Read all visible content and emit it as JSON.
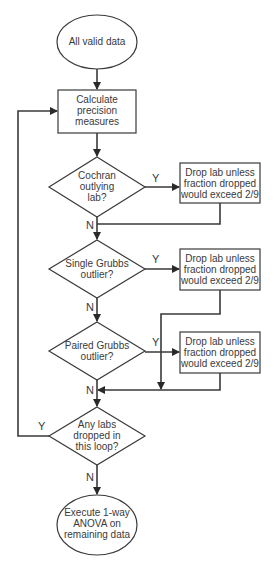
{
  "diagram": {
    "type": "flowchart",
    "nodes": {
      "start": {
        "shape": "oval",
        "lines": [
          "All valid data"
        ]
      },
      "calc": {
        "shape": "rect",
        "lines": [
          "Calculate",
          "precision",
          "measures"
        ]
      },
      "cochran": {
        "shape": "diamond",
        "lines": [
          "Cochran",
          "outlying",
          "lab?"
        ]
      },
      "drop1": {
        "shape": "rect",
        "lines": [
          "Drop lab unless",
          "fraction dropped",
          "would exceed 2/9"
        ]
      },
      "single": {
        "shape": "diamond",
        "lines": [
          "Single Grubbs",
          "outlier?"
        ]
      },
      "drop2": {
        "shape": "rect",
        "lines": [
          "Drop lab unless",
          "fraction dropped",
          "would exceed 2/9"
        ]
      },
      "paired": {
        "shape": "diamond",
        "lines": [
          "Paired Grubbs",
          "outlier?"
        ]
      },
      "drop3": {
        "shape": "rect",
        "lines": [
          "Drop lab unless",
          "fraction dropped",
          "would exceed 2/9"
        ]
      },
      "any": {
        "shape": "diamond",
        "lines": [
          "Any labs",
          "dropped in",
          "this loop?"
        ]
      },
      "end": {
        "shape": "oval",
        "lines": [
          "Execute 1-way",
          "ANOVA on",
          "remaining data"
        ]
      }
    },
    "edge_labels": {
      "cochran_yes": "Y",
      "cochran_no": "N",
      "single_yes": "Y",
      "single_no": "N",
      "paired_yes": "Y",
      "paired_no": "N",
      "any_yes": "Y",
      "any_no": "N"
    },
    "colors": {
      "stroke": "#3a3a3a",
      "fill": "#ffffff",
      "text": "#3a3a3a"
    }
  }
}
